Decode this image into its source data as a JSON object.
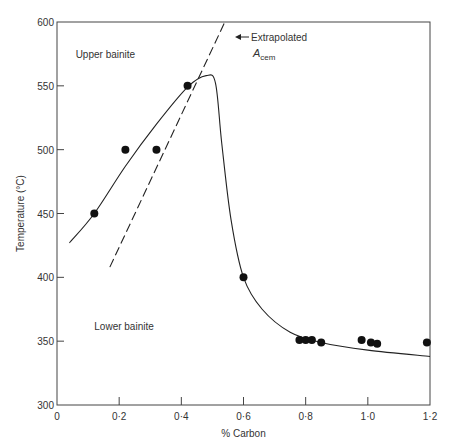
{
  "chart_data": {
    "type": "scatter",
    "title": "",
    "xlabel": "% Carbon",
    "ylabel": "Temperature (°C)",
    "xlim": [
      0,
      1.2
    ],
    "ylim": [
      300,
      600
    ],
    "x_ticks": [
      "0",
      "0·2",
      "0·4",
      "0·6",
      "0·8",
      "1·0",
      "1·2"
    ],
    "y_ticks": [
      "300",
      "350",
      "400",
      "450",
      "500",
      "550",
      "600"
    ],
    "grid": false,
    "legend": null,
    "points": [
      {
        "x": 0.12,
        "y": 450
      },
      {
        "x": 0.22,
        "y": 500
      },
      {
        "x": 0.32,
        "y": 500
      },
      {
        "x": 0.42,
        "y": 550
      },
      {
        "x": 0.6,
        "y": 400
      },
      {
        "x": 0.78,
        "y": 351
      },
      {
        "x": 0.8,
        "y": 351
      },
      {
        "x": 0.82,
        "y": 351
      },
      {
        "x": 0.85,
        "y": 349
      },
      {
        "x": 0.98,
        "y": 351
      },
      {
        "x": 1.01,
        "y": 349
      },
      {
        "x": 1.03,
        "y": 348
      },
      {
        "x": 1.19,
        "y": 349
      }
    ],
    "series": [
      {
        "name": "Bainite boundary curve (solid)",
        "style": "solid",
        "x": [
          0.04,
          0.12,
          0.22,
          0.32,
          0.42,
          0.48,
          0.51,
          0.53,
          0.56,
          0.6,
          0.66,
          0.75,
          0.85,
          1.0,
          1.2
        ],
        "y": [
          427,
          450,
          487,
          520,
          549,
          558,
          552,
          505,
          445,
          400,
          375,
          357,
          349,
          343,
          338
        ]
      },
      {
        "name": "Extrapolated A_cem (dashed)",
        "style": "dashed",
        "x": [
          0.17,
          0.54
        ],
        "y": [
          408,
          600
        ]
      }
    ],
    "annotations": [
      {
        "text": "Upper bainite",
        "x": 0.06,
        "y": 575
      },
      {
        "text": "Lower bainite",
        "x": 0.12,
        "y": 362
      },
      {
        "text": "Extrapolated",
        "x": 0.57,
        "y": 590
      },
      {
        "text": "A",
        "subscript": "cem",
        "x": 0.58,
        "y": 575
      }
    ]
  }
}
